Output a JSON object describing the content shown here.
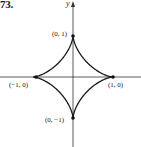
{
  "figure": {
    "number": "73.",
    "axis_labels": {
      "y": "y"
    },
    "points": [
      {
        "label": "(0, 1)",
        "x": 0,
        "y": 1
      },
      {
        "label": "(−1, 0)",
        "x": -1,
        "y": 0
      },
      {
        "label": "(1, 0)",
        "x": 1,
        "y": 0
      },
      {
        "label": "(0, −1)",
        "x": 0,
        "y": -1
      }
    ],
    "curve": "astroid x^(2/3) + y^(2/3) = 1"
  },
  "chart_data": {
    "type": "line",
    "title": "",
    "xlabel": "",
    "ylabel": "y",
    "xlim": [
      -1.8,
      1.7
    ],
    "ylim": [
      -1.7,
      1.85
    ],
    "grid": false,
    "series": [
      {
        "name": "astroid",
        "equation": "x^(2/3) + y^(2/3) = 1"
      }
    ],
    "annotations": [
      "(0, 1)",
      "(−1, 0)",
      "(1, 0)",
      "(0, −1)"
    ]
  }
}
